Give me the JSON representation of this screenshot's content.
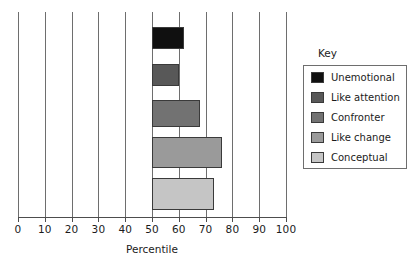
{
  "chart_data": {
    "type": "bar",
    "orientation": "horizontal",
    "title": "",
    "xlabel": "Percentile",
    "ylabel": "",
    "xlim": [
      0,
      100
    ],
    "xticks": [
      0,
      10,
      20,
      30,
      40,
      50,
      60,
      70,
      80,
      90,
      100
    ],
    "xtick_labels": [
      "0",
      "10",
      "20",
      "30",
      "40",
      "50",
      "60",
      "70",
      "80",
      "90",
      "100"
    ],
    "grid": "vertical",
    "bar_baseline": 50,
    "categories": [
      "Unemotional",
      "Like attention",
      "Confronter",
      "Like change",
      "Conceptual"
    ],
    "values": [
      62,
      60,
      68,
      76,
      73
    ],
    "colors": [
      "#101010",
      "#585858",
      "#727272",
      "#9a9a9a",
      "#c5c5c5"
    ],
    "legend": {
      "title": "Key",
      "position": "right",
      "entries": [
        {
          "label": "Unemotional",
          "color": "#101010",
          "value": 62
        },
        {
          "label": "Like attention",
          "color": "#585858",
          "value": 60
        },
        {
          "label": "Confronter",
          "color": "#727272",
          "value": 68
        },
        {
          "label": "Like change",
          "color": "#9a9a9a",
          "value": 76
        },
        {
          "label": "Conceptual",
          "color": "#c5c5c5",
          "value": 73
        }
      ]
    }
  },
  "axis": {
    "x_label": "Percentile",
    "tick_0": "0",
    "tick_10": "10",
    "tick_20": "20",
    "tick_30": "30",
    "tick_40": "40",
    "tick_50": "50",
    "tick_60": "60",
    "tick_70": "70",
    "tick_80": "80",
    "tick_90": "90",
    "tick_100": "100"
  },
  "legend": {
    "title": "Key",
    "item_0_label": "Unemotional",
    "item_1_label": "Like attention",
    "item_2_label": "Confronter",
    "item_3_label": "Like change",
    "item_4_label": "Conceptual"
  }
}
